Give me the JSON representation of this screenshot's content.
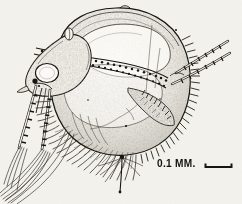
{
  "figure": {
    "technique": "stipple and line engraving",
    "background_color": "#f4f2ec",
    "ink_color": "#15130f"
  },
  "scale": {
    "label": "0.1 MM.",
    "bar_name": "scale-bar",
    "bar_length_px": 27,
    "bar_x": 205,
    "bar_y": 167
  },
  "anatomy": {
    "carapace": "carapace",
    "dorsal_margin": "dorsal-carapace-margin",
    "ventral_margin": "ventral-carapace-margin",
    "setal_fringe": "ventral-setal-fringe",
    "spinule_comb": "posterior-spinule-comb",
    "head": "head-shield",
    "compound_eye": "compound-eye",
    "ocellus": "ocellus",
    "pigment_spot": "pigment-spot",
    "gut": "granular-gut",
    "brood_chamber": "brood-chamber",
    "antenna_first": "first-antenna",
    "antenna_second": "second-antenna",
    "swimming_setae": "swimming-setae",
    "postabdomen": "postabdomen",
    "postabdominal_claw": "postabdominal-claw",
    "caudal_setae": "caudal-setae",
    "thoracic_limb": "thoracic-limb",
    "rostrum": "rostrum"
  }
}
